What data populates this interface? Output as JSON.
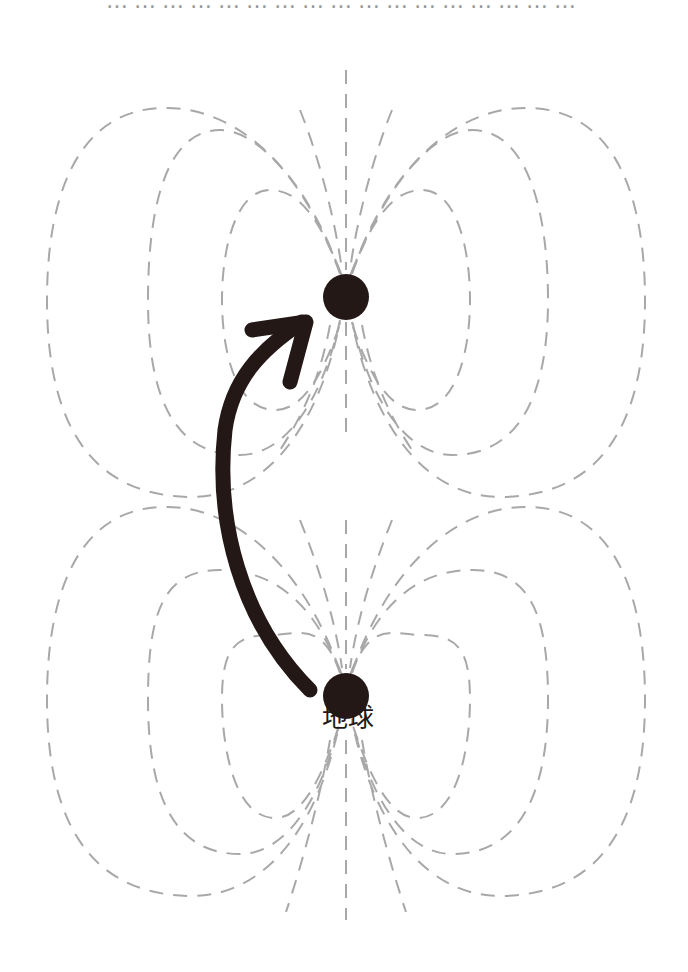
{
  "diagram": {
    "top_caption_cut": "……………………………………………",
    "labels": {
      "earth": "地球"
    },
    "colors": {
      "field_line": "#a8a8a8",
      "body": "#231815",
      "arrow": "#231815",
      "background": "#ffffff"
    },
    "bodies": [
      {
        "name": "upper-body",
        "cx": 346,
        "cy": 297,
        "r": 23
      },
      {
        "name": "earth",
        "cx": 346,
        "cy": 696,
        "r": 23,
        "label": "地球"
      }
    ],
    "arrow": {
      "from": "earth",
      "to": "upper-body",
      "description": "curved arrow from Earth toward upper body"
    },
    "field_patterns": [
      {
        "center": "upper-body",
        "type": "dipole",
        "loops_per_side": 3
      },
      {
        "center": "earth",
        "type": "dipole",
        "loops_per_side": 3
      }
    ]
  }
}
